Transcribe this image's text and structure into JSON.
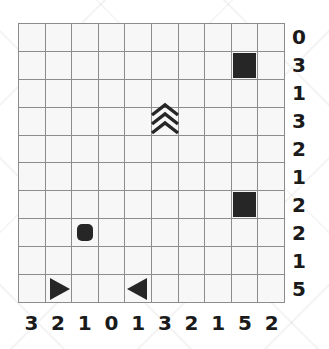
{
  "figure": {
    "grid": {
      "rows": 10,
      "columns": 10,
      "line_color": "#8c8c8c",
      "cell_color": "#f7f7f7",
      "glyph_color": "#262626"
    },
    "row_labels": [
      "0",
      "3",
      "1",
      "3",
      "2",
      "1",
      "2",
      "2",
      "1",
      "5"
    ],
    "column_labels": [
      "3",
      "2",
      "1",
      "0",
      "1",
      "3",
      "2",
      "1",
      "5",
      "2"
    ],
    "glyphs": [
      {
        "id": "filled-square-top",
        "shape": "filled-square",
        "row": 2,
        "col": 9
      },
      {
        "id": "wave-chevrons",
        "shape": "wave",
        "row": 4,
        "col": 6
      },
      {
        "id": "filled-square-mid",
        "shape": "filled-square",
        "row": 7,
        "col": 9
      },
      {
        "id": "rounded-square",
        "shape": "rounded-square",
        "row": 8,
        "col": 3
      },
      {
        "id": "triangle-right",
        "shape": "triangle-right",
        "row": 10,
        "col": 2
      },
      {
        "id": "triangle-left",
        "shape": "triangle-left",
        "row": 10,
        "col": 5
      }
    ]
  }
}
